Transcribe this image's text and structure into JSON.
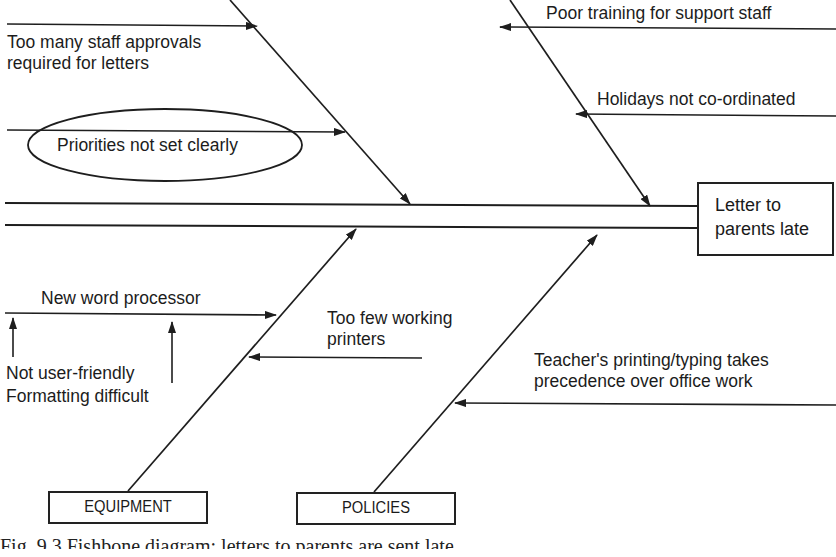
{
  "diagram": {
    "type": "fishbone",
    "effect": {
      "line1": "Letter to",
      "line2": "parents late"
    },
    "categories": [
      {
        "id": "equipment",
        "label": "EQUIPMENT"
      },
      {
        "id": "policies",
        "label": "POLICIES"
      }
    ],
    "causes": {
      "upper_left_1": {
        "line1": "Too many staff approvals",
        "line2": "required for letters"
      },
      "upper_left_2": {
        "text": "Priorities not set clearly",
        "highlighted": true
      },
      "upper_right_1": {
        "text": "Poor training for support staff"
      },
      "upper_right_2": {
        "text": "Holidays not co-ordinated"
      },
      "equipment_1": {
        "text": "New word processor"
      },
      "equipment_1_sub_a": {
        "text": "Not user-friendly"
      },
      "equipment_1_sub_b": {
        "text": "Formatting difficult"
      },
      "equipment_2": {
        "line1": "Too few working",
        "line2": "printers"
      },
      "policies_1": {
        "line1": "Teacher's printing/typing takes",
        "line2": "precedence over office work"
      }
    },
    "caption": "Fig. 9.3   Fishbone diagram: letters to parents are sent late"
  },
  "colors": {
    "line": "#1e1e1e",
    "background": "#ffffff"
  }
}
